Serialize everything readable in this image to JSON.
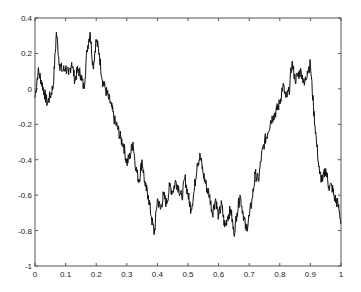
{
  "chart_data": {
    "type": "line",
    "title": "",
    "xlabel": "",
    "ylabel": "",
    "xlim": [
      0,
      1
    ],
    "ylim": [
      -1,
      0.4
    ],
    "grid": false,
    "legend": null,
    "x_ticks": [
      "0",
      "0.1",
      "0.2",
      "0.3",
      "0.4",
      "0.5",
      "0.6",
      "0.7",
      "0.8",
      "0.9",
      "1"
    ],
    "y_ticks": [
      "0.4",
      "0.2",
      "0",
      "-0.2",
      "-0.4",
      "-0.6",
      "-0.8",
      "-1"
    ],
    "line_color": "#111111",
    "series": [
      {
        "name": "signal",
        "x": [
          0,
          0.01,
          0.02,
          0.03,
          0.04,
          0.05,
          0.06,
          0.07,
          0.08,
          0.09,
          0.1,
          0.11,
          0.12,
          0.13,
          0.14,
          0.15,
          0.16,
          0.17,
          0.18,
          0.19,
          0.2,
          0.21,
          0.22,
          0.23,
          0.24,
          0.25,
          0.26,
          0.27,
          0.28,
          0.29,
          0.3,
          0.31,
          0.32,
          0.33,
          0.34,
          0.35,
          0.36,
          0.37,
          0.38,
          0.39,
          0.4,
          0.41,
          0.42,
          0.43,
          0.44,
          0.45,
          0.46,
          0.47,
          0.48,
          0.49,
          0.5,
          0.51,
          0.52,
          0.53,
          0.54,
          0.55,
          0.56,
          0.57,
          0.58,
          0.59,
          0.6,
          0.61,
          0.62,
          0.63,
          0.64,
          0.65,
          0.66,
          0.67,
          0.68,
          0.69,
          0.7,
          0.71,
          0.72,
          0.73,
          0.74,
          0.75,
          0.76,
          0.77,
          0.78,
          0.79,
          0.8,
          0.81,
          0.82,
          0.83,
          0.84,
          0.85,
          0.86,
          0.87,
          0.88,
          0.89,
          0.9,
          0.91,
          0.92,
          0.93,
          0.94,
          0.95,
          0.96,
          0.97,
          0.98,
          0.99,
          1.0
        ],
        "values": [
          -0.05,
          0.1,
          0.05,
          -0.02,
          -0.08,
          -0.04,
          0.02,
          0.32,
          0.14,
          0.1,
          0.12,
          0.08,
          0.15,
          0.05,
          0.11,
          0.08,
          0.0,
          0.22,
          0.32,
          0.12,
          0.28,
          0.2,
          0.05,
          0.0,
          -0.05,
          -0.1,
          -0.18,
          -0.22,
          -0.28,
          -0.32,
          -0.42,
          -0.38,
          -0.3,
          -0.45,
          -0.52,
          -0.4,
          -0.55,
          -0.6,
          -0.72,
          -0.82,
          -0.62,
          -0.68,
          -0.6,
          -0.65,
          -0.55,
          -0.58,
          -0.52,
          -0.56,
          -0.62,
          -0.5,
          -0.6,
          -0.68,
          -0.58,
          -0.42,
          -0.38,
          -0.48,
          -0.55,
          -0.6,
          -0.7,
          -0.62,
          -0.72,
          -0.65,
          -0.78,
          -0.72,
          -0.68,
          -0.82,
          -0.7,
          -0.6,
          -0.7,
          -0.8,
          -0.72,
          -0.62,
          -0.48,
          -0.52,
          -0.38,
          -0.3,
          -0.25,
          -0.18,
          -0.15,
          -0.12,
          -0.08,
          0.02,
          -0.05,
          -0.02,
          0.15,
          0.05,
          0.08,
          0.1,
          0.02,
          0.1,
          0.14,
          -0.1,
          -0.3,
          -0.48,
          -0.52,
          -0.45,
          -0.55,
          -0.55,
          -0.62,
          -0.65,
          -0.75
        ]
      }
    ]
  }
}
